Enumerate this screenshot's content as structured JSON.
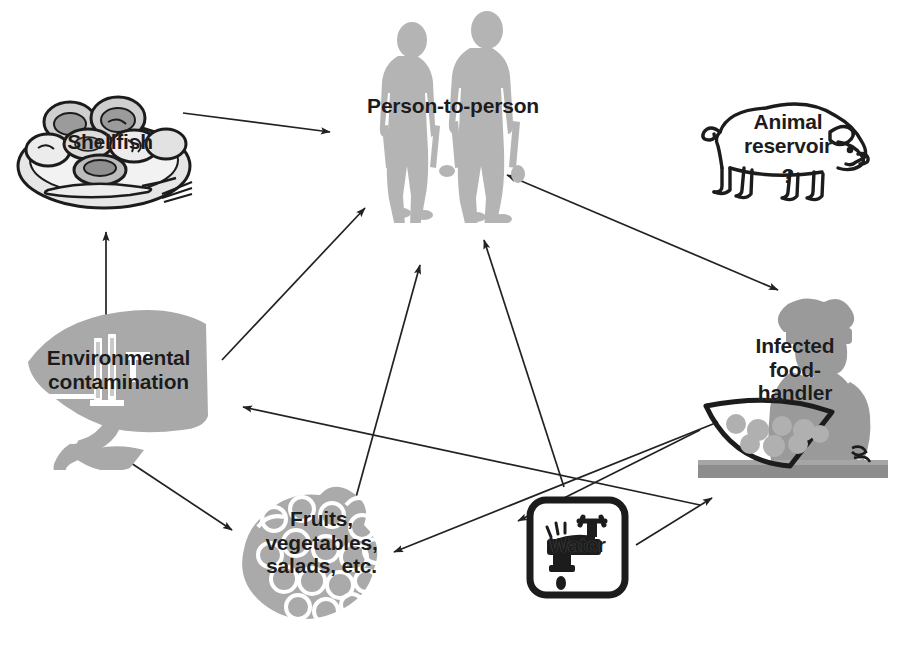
{
  "figure": {
    "caption": "",
    "colors": {
      "silhouette_gray": "#b3b3b3",
      "handler_gray": "#9a9a9a",
      "produce_gray": "#aaaaaa",
      "env_gray": "#a8a8a8",
      "ink": "#1c1c1c",
      "arrow": "#222222",
      "background": "#ffffff"
    }
  },
  "nodes": [
    {
      "id": "person",
      "label": "Person-to-person",
      "icon": "two-people-walking-silhouette",
      "x": 452,
      "y": 115
    },
    {
      "id": "shellfish",
      "label": "Shellfish",
      "icon": "plate-of-shellfish",
      "x": 108,
      "y": 148
    },
    {
      "id": "animal",
      "label": "Animal\nreservoir",
      "qmark": "?",
      "icon": "pig-outline",
      "x": 790,
      "y": 150
    },
    {
      "id": "environment",
      "label": "Environmental\ncontamination",
      "icon": "factory-pollution-shape",
      "x": 113,
      "y": 385
    },
    {
      "id": "handler",
      "label": "Infected\nfood-\nhandler",
      "icon": "chef-with-tray-silhouette",
      "x": 794,
      "y": 390
    },
    {
      "id": "fruits",
      "label": "Fruits,\nvegetables,\nsalads, etc.",
      "icon": "grape-cluster",
      "x": 320,
      "y": 560
    },
    {
      "id": "water",
      "label": "Water",
      "icon": "faucet-water-drop-sign",
      "x": 577,
      "y": 547
    }
  ],
  "edges": [
    {
      "id": "shellfish-to-person",
      "from": "shellfish",
      "to": "person",
      "style": "single"
    },
    {
      "id": "environment-to-shellfish",
      "from": "environment",
      "to": "shellfish",
      "style": "single"
    },
    {
      "id": "environment-to-person",
      "from": "environment",
      "to": "person",
      "style": "single"
    },
    {
      "id": "environment-to-fruits",
      "from": "environment",
      "to": "fruits",
      "style": "single"
    },
    {
      "id": "fruits-to-person",
      "from": "fruits",
      "to": "person",
      "style": "single"
    },
    {
      "id": "water-to-person",
      "from": "water",
      "to": "person",
      "style": "single"
    },
    {
      "id": "person-handler",
      "from": "person",
      "to": "handler",
      "style": "double"
    },
    {
      "id": "handler-to-environment",
      "from": "handler",
      "to": "environment",
      "style": "single"
    },
    {
      "id": "handler-to-fruits",
      "from": "handler",
      "to": "fruits",
      "style": "single"
    },
    {
      "id": "handler-to-water",
      "from": "handler",
      "to": "water",
      "style": "single"
    },
    {
      "id": "water-to-handler",
      "from": "water",
      "to": "handler",
      "style": "single"
    }
  ]
}
